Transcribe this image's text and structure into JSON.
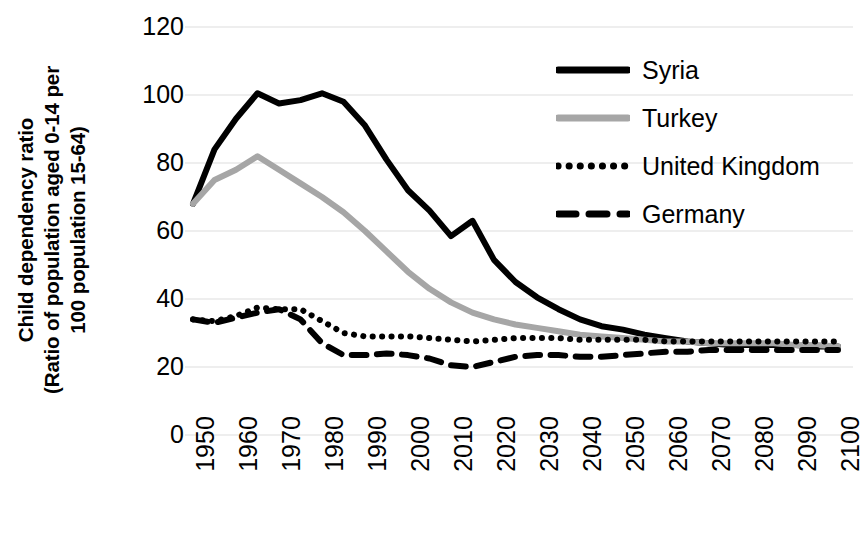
{
  "chart_data": {
    "type": "line",
    "title": "",
    "xlabel": "",
    "ylabel": "Child dependency ratio (Ratio of population aged 0-14 per 100 population 15-64)",
    "ylabel_lines": [
      "Child dependency ratio",
      "(Ratio of population aged 0-14 per",
      "100 population 15-64)"
    ],
    "xlim": [
      1950,
      2100
    ],
    "ylim": [
      0,
      120
    ],
    "y_ticks": [
      120,
      100,
      80,
      60,
      40,
      20,
      0
    ],
    "y_tick_labels": [
      "120",
      "100",
      "80",
      "60",
      "40",
      "20",
      "0"
    ],
    "x_ticks": [
      1950,
      1960,
      1970,
      1980,
      1990,
      2000,
      2010,
      2020,
      2030,
      2040,
      2050,
      2060,
      2070,
      2080,
      2090,
      2100
    ],
    "x_tick_labels": [
      "1950",
      "1960",
      "1970",
      "1980",
      "1990",
      "2000",
      "2010",
      "2020",
      "2030",
      "2040",
      "2050",
      "2060",
      "2070",
      "2080",
      "2090",
      "2100"
    ],
    "grid": true,
    "grid_axis": "y",
    "legend_position": "upper right",
    "x": [
      1950,
      1955,
      1960,
      1965,
      1970,
      1975,
      1980,
      1985,
      1990,
      1995,
      2000,
      2005,
      2010,
      2015,
      2020,
      2025,
      2030,
      2035,
      2040,
      2045,
      2050,
      2055,
      2060,
      2065,
      2070,
      2075,
      2080,
      2085,
      2090,
      2095,
      2100
    ],
    "series": [
      {
        "name": "Syria",
        "style": "solid",
        "color": "#000000",
        "width": 6,
        "values": [
          68,
          84,
          93,
          100.5,
          97.5,
          98.5,
          100.5,
          98,
          91,
          81,
          72,
          66,
          58.5,
          63,
          51.5,
          45,
          40.5,
          37,
          34,
          32,
          31,
          29.5,
          28.5,
          27.5,
          27,
          26.5,
          26.5,
          26.5,
          26.5,
          26,
          26
        ]
      },
      {
        "name": "Turkey",
        "style": "solid",
        "color": "#a6a6a6",
        "width": 6,
        "values": [
          68,
          75,
          78,
          82,
          78,
          74,
          70,
          65.5,
          60,
          54,
          48,
          43,
          39,
          36,
          34,
          32.5,
          31.5,
          30.5,
          29.5,
          29,
          28.5,
          28,
          27.5,
          27.5,
          27,
          27,
          27,
          27,
          26.5,
          26.5,
          26
        ]
      },
      {
        "name": "United Kingdom",
        "style": "dotted",
        "color": "#000000",
        "width": 6,
        "values": [
          34,
          33.5,
          35,
          37.5,
          37,
          37,
          33.5,
          30,
          29,
          29,
          29,
          28.5,
          28,
          27.5,
          28,
          28.5,
          28.5,
          28.5,
          28,
          28,
          28,
          28,
          27.5,
          27.5,
          27.5,
          27.5,
          27.5,
          27.5,
          27.5,
          27.5,
          27.5
        ]
      },
      {
        "name": "Germany",
        "style": "dashed",
        "color": "#000000",
        "width": 6,
        "values": [
          34,
          33,
          34.5,
          36,
          37,
          34,
          27,
          23.5,
          23.5,
          24,
          23.5,
          22.5,
          20.5,
          20,
          21.5,
          23,
          23.5,
          23.5,
          23,
          23,
          23.5,
          24,
          24.5,
          24.5,
          25,
          25,
          25,
          25,
          25,
          25,
          25
        ]
      }
    ]
  },
  "legend": {
    "items": [
      {
        "label": "Syria",
        "style": "solid",
        "color": "#000000"
      },
      {
        "label": "Turkey",
        "style": "solid",
        "color": "#a6a6a6"
      },
      {
        "label": "United Kingdom",
        "style": "dotted",
        "color": "#000000"
      },
      {
        "label": "Germany",
        "style": "dashed",
        "color": "#000000"
      }
    ]
  },
  "colors": {
    "background": "#ffffff",
    "gridline": "#e8e8e8",
    "text": "#000000",
    "syria": "#000000",
    "turkey": "#a6a6a6",
    "united_kingdom": "#000000",
    "germany": "#000000"
  }
}
